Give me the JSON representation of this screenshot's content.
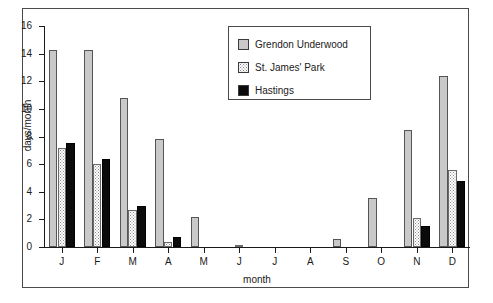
{
  "chart_data": {
    "type": "bar",
    "title": "",
    "xlabel": "month",
    "ylabel": "days/month",
    "ylim": [
      0,
      16
    ],
    "yticks": [
      0,
      2,
      4,
      6,
      8,
      10,
      12,
      14,
      16
    ],
    "grid": false,
    "legend_position": "top-center-inside",
    "categories": [
      "J",
      "F",
      "M",
      "A",
      "M",
      "J",
      "J",
      "A",
      "S",
      "O",
      "N",
      "D"
    ],
    "series": [
      {
        "name": "Grendon Underwood",
        "color": "#c9c9c9",
        "values": [
          14.3,
          14.3,
          10.8,
          7.8,
          2.2,
          0.0,
          0.0,
          0.0,
          0.6,
          3.55,
          8.5,
          12.4
        ]
      },
      {
        "name": "St. James' Park",
        "color": "#ffffff",
        "values": [
          7.15,
          6.0,
          2.7,
          0.4,
          0.0,
          0.15,
          0.0,
          0.0,
          0.0,
          0.0,
          2.1,
          5.6
        ]
      },
      {
        "name": "Hastings",
        "color": "#0b0b0b",
        "values": [
          7.5,
          6.4,
          3.0,
          0.7,
          0.0,
          0.0,
          0.0,
          0.0,
          0.0,
          0.0,
          1.5,
          4.8
        ]
      }
    ]
  },
  "legend": {
    "items": [
      {
        "label": "Grendon Underwood",
        "swatch": "grendon"
      },
      {
        "label": "St. James' Park",
        "swatch": "stjames"
      },
      {
        "label": "Hastings",
        "swatch": "hastings"
      }
    ]
  },
  "axes": {
    "y_label": "days/month",
    "x_label": "month",
    "y_tick_labels": [
      "0",
      "2",
      "4",
      "6",
      "8",
      "10",
      "12",
      "14",
      "16"
    ],
    "x_tick_labels": [
      "J",
      "F",
      "M",
      "A",
      "M",
      "J",
      "J",
      "A",
      "S",
      "O",
      "N",
      "D"
    ]
  }
}
